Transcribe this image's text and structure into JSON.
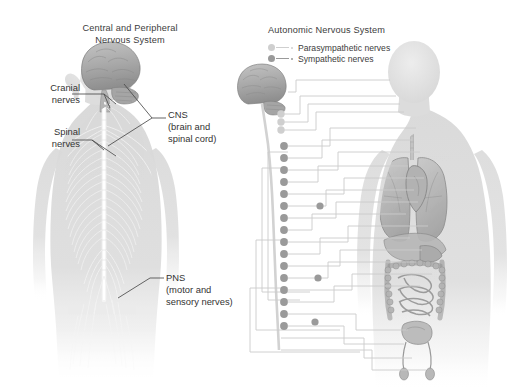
{
  "figure": {
    "kind": "anatomical-illustration",
    "background_color": "#ffffff",
    "text_color": "#3c3c3c"
  },
  "left_panel": {
    "title": "Central and Peripheral\nNervous System",
    "annotations": {
      "cranial": "Cranial\nnerves",
      "spinal": "Spinal\nnerves",
      "cns": "CNS\n(brain and\nspinal cord)",
      "pns": "PNS\n(motor and\nsensory  nerves)"
    }
  },
  "right_panel": {
    "title": "Autonomic Nervous System",
    "legend": [
      {
        "label": "Parasympathetic nerves",
        "color": "#cfcfcf",
        "dot": "parasympathetic-dot"
      },
      {
        "label": "Sympathetic nerves",
        "color": "#9a9a9a",
        "dot": "sympathetic-dot"
      }
    ]
  },
  "colors": {
    "body_fill": "#dcdcdc",
    "body_fill_light": "#e6e6e6",
    "organ_fill": "#b9b9b9",
    "organ_stroke": "#8c8c8c",
    "brain_fill": "#b0b0b0",
    "brain_stroke": "#7d7d7d",
    "nerve_white": "#f2f2f2",
    "ganglion_sympathetic": "#9a9a9a",
    "ganglion_parasympathetic": "#cfcfcf",
    "route_line": "#c9c9c9",
    "leader_line": "#4a4a4a"
  }
}
